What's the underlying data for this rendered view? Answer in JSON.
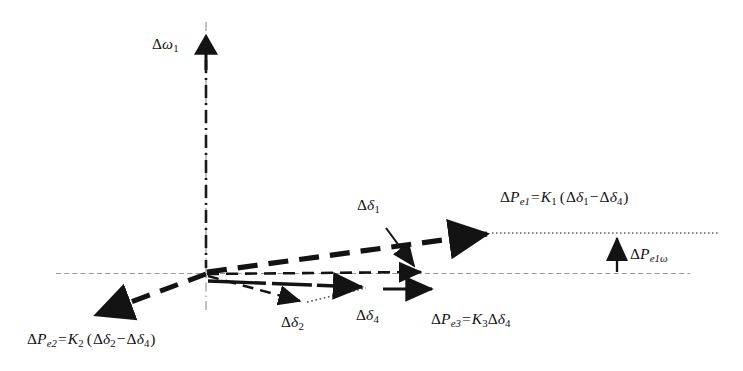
{
  "figure": {
    "kind": "phasor-vector-diagram",
    "background_color": "#ffffff",
    "ink_color": "#131313",
    "axis_color": "#9a9a9a"
  },
  "axes": {
    "vertical": {
      "label_delta": "Δ",
      "label_symbol": "ω",
      "label_sub": "1",
      "style": "dash-dot",
      "has_arrowhead": true
    },
    "horizontal": {
      "style": "fine-dashed",
      "has_arrowhead": false
    }
  },
  "vectors": [
    {
      "name": "delta-P-e1",
      "style": "thick-dashed",
      "label": {
        "delta": "Δ",
        "symbol": "P",
        "sub": "e1",
        "equals": "=",
        "gain": "K",
        "gain_sub": "1",
        "open_paren": "(",
        "term1_delta": "Δ",
        "term1_symbol": "δ",
        "term1_sub": "1",
        "minus": "−",
        "term2_delta": "Δ",
        "term2_symbol": "δ",
        "term2_sub": "4",
        "close_paren": ")"
      }
    },
    {
      "name": "delta-P-e2",
      "style": "thick-dashed",
      "label": {
        "delta": "Δ",
        "symbol": "P",
        "sub": "e2",
        "equals": "=",
        "gain": "K",
        "gain_sub": "2",
        "open_paren": "(",
        "term1_delta": "Δ",
        "term1_symbol": "δ",
        "term1_sub": "2",
        "minus": "−",
        "term2_delta": "Δ",
        "term2_symbol": "δ",
        "term2_sub": "4",
        "close_paren": ")"
      }
    },
    {
      "name": "delta-P-e3",
      "style": "solid-arrow",
      "label": {
        "delta": "Δ",
        "symbol": "P",
        "sub": "e3",
        "equals": "=",
        "gain": "K",
        "gain_sub": "3",
        "term_delta": "Δ",
        "term_symbol": "δ",
        "term_sub": "4"
      }
    },
    {
      "name": "delta-delta-1",
      "style": "medium-dashed",
      "label": {
        "delta": "Δ",
        "symbol": "δ",
        "sub": "1"
      },
      "has_leader_arrow": true
    },
    {
      "name": "delta-delta-2",
      "style": "medium-dashed",
      "label": {
        "delta": "Δ",
        "symbol": "δ",
        "sub": "2"
      }
    },
    {
      "name": "delta-delta-4",
      "style": "solid-arrow",
      "label": {
        "delta": "Δ",
        "symbol": "δ",
        "sub": "4"
      }
    },
    {
      "name": "delta-P-e1-omega",
      "style": "vertical-measure",
      "label": {
        "delta": "Δ",
        "symbol": "P",
        "sub_e": "e1",
        "sub_omega": "ω"
      }
    }
  ],
  "guides": {
    "projection_dotted": "dotted-horizontal-from-Pe1-tip",
    "connector_dotted": "dotted-from-delta2-tip-to-delta4-tip"
  }
}
